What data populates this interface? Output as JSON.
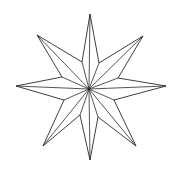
{
  "figure": {
    "description": "Eight-pointed faceted star line drawing",
    "points": 8,
    "stroke_color": "#2a2a2a",
    "background": "#ffffff",
    "center": [
      89,
      89
    ],
    "tips": [
      {
        "name": "top",
        "x": 90,
        "y": 14
      },
      {
        "name": "upper-right",
        "x": 143,
        "y": 36
      },
      {
        "name": "right",
        "x": 166,
        "y": 86
      },
      {
        "name": "lower-right",
        "x": 136,
        "y": 146
      },
      {
        "name": "bottom",
        "x": 90,
        "y": 160
      },
      {
        "name": "lower-left",
        "x": 43,
        "y": 146
      },
      {
        "name": "left",
        "x": 16,
        "y": 86
      },
      {
        "name": "upper-left",
        "x": 37,
        "y": 35
      }
    ],
    "valleys": [
      {
        "x": 99,
        "y": 63
      },
      {
        "x": 118,
        "y": 78
      },
      {
        "x": 114,
        "y": 100
      },
      {
        "x": 98,
        "y": 117
      },
      {
        "x": 80,
        "y": 115
      },
      {
        "x": 64,
        "y": 100
      },
      {
        "x": 62,
        "y": 77
      },
      {
        "x": 82,
        "y": 62
      }
    ]
  }
}
